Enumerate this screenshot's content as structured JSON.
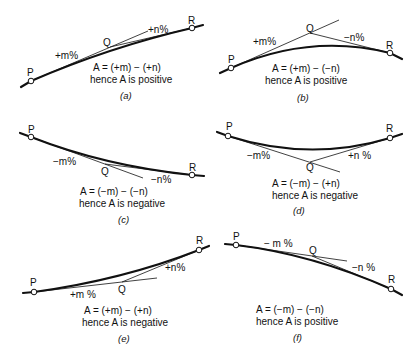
{
  "figure": {
    "panels": [
      {
        "id": "a",
        "caption": "(a)",
        "points": {
          "P": "P",
          "Q": "Q",
          "R": "R"
        },
        "grade_in": "+m%",
        "grade_out": "+n%",
        "equation": "A = (+m) − (+n)",
        "conclusion": "hence A is positive"
      },
      {
        "id": "b",
        "caption": "(b)",
        "points": {
          "P": "P",
          "Q": "Q",
          "R": "R"
        },
        "grade_in": "+m%",
        "grade_out": "−n%",
        "equation": "A = (+m) − (−n)",
        "conclusion": "hence A is positive"
      },
      {
        "id": "c",
        "caption": "(c)",
        "points": {
          "P": "P",
          "Q": "Q",
          "R": "R"
        },
        "grade_in": "−m%",
        "grade_out": "−n%",
        "equation": "A = (−m) − (−n)",
        "conclusion": "hence A is negative"
      },
      {
        "id": "d",
        "caption": "(d)",
        "points": {
          "P": "P",
          "Q": "Q",
          "R": "R"
        },
        "grade_in": "−m%",
        "grade_out": "+n %",
        "equation": "A = (−m) − (+n)",
        "conclusion": "hence A is negative"
      },
      {
        "id": "e",
        "caption": "(e)",
        "points": {
          "P": "P",
          "Q": "Q",
          "R": "R"
        },
        "grade_in": "+m %",
        "grade_out": "+n%",
        "equation": "A = (+m) − (+n)",
        "conclusion": "hence A is negative"
      },
      {
        "id": "f",
        "caption": "(f)",
        "points": {
          "P": "P",
          "Q": "Q",
          "R": "R"
        },
        "grade_in": "− m %",
        "grade_out": "−n %",
        "equation": "A = (−m) − (−n)",
        "conclusion": "hence A is positive"
      }
    ]
  }
}
